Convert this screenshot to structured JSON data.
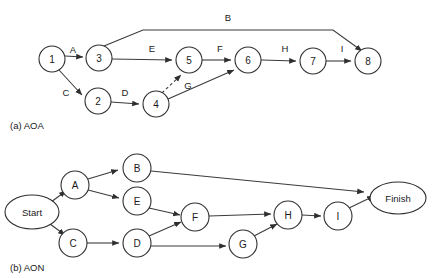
{
  "figure": {
    "colors": {
      "stroke": "#3b3b3b",
      "node_stroke": "#2f2f2f",
      "node_fill": "#ffffff",
      "text": "#1a1a1a",
      "background": "#ffffff"
    },
    "captions": {
      "aoa": "(a) AOA",
      "aon": "(b) AON"
    }
  },
  "aoa": {
    "nodes": [
      {
        "id": "n1",
        "label": "1",
        "cx": 52,
        "cy": 59,
        "r": 13
      },
      {
        "id": "n2",
        "label": "2",
        "cx": 98,
        "cy": 101,
        "r": 13
      },
      {
        "id": "n3",
        "label": "3",
        "cx": 99,
        "cy": 58,
        "r": 13
      },
      {
        "id": "n4",
        "label": "4",
        "cx": 156,
        "cy": 104,
        "r": 13
      },
      {
        "id": "n5",
        "label": "5",
        "cx": 189,
        "cy": 60,
        "r": 13
      },
      {
        "id": "n6",
        "label": "6",
        "cx": 248,
        "cy": 60,
        "r": 13
      },
      {
        "id": "n7",
        "label": "7",
        "cx": 313,
        "cy": 61,
        "r": 13
      },
      {
        "id": "n8",
        "label": "8",
        "cx": 368,
        "cy": 61,
        "r": 13
      }
    ],
    "edge_labels": [
      {
        "id": "A",
        "label": "A",
        "x": 73,
        "y": 49
      },
      {
        "id": "B",
        "label": "B",
        "x": 228,
        "y": 17
      },
      {
        "id": "C",
        "label": "C",
        "x": 66,
        "y": 92
      },
      {
        "id": "D",
        "label": "D",
        "x": 125,
        "y": 92
      },
      {
        "id": "E",
        "label": "E",
        "x": 152,
        "y": 48
      },
      {
        "id": "F",
        "label": "F",
        "x": 220,
        "y": 48
      },
      {
        "id": "G",
        "label": "G",
        "x": 188,
        "y": 85
      },
      {
        "id": "H",
        "label": "H",
        "x": 285,
        "y": 48
      },
      {
        "id": "I",
        "label": "I",
        "x": 342,
        "y": 48
      }
    ],
    "edges": [
      {
        "id": "A",
        "from": "n1",
        "to": "n3",
        "style": "solid"
      },
      {
        "id": "B",
        "from": "n3",
        "to": "n8",
        "style": "solid"
      },
      {
        "id": "C",
        "from": "n1",
        "to": "n2",
        "style": "solid"
      },
      {
        "id": "D",
        "from": "n2",
        "to": "n4",
        "style": "solid"
      },
      {
        "id": "E",
        "from": "n3",
        "to": "n5",
        "style": "solid"
      },
      {
        "id": "dummy",
        "from": "n4",
        "to": "n5",
        "style": "dashed"
      },
      {
        "id": "G",
        "from": "n4",
        "to": "n6",
        "style": "solid"
      },
      {
        "id": "F",
        "from": "n5",
        "to": "n6",
        "style": "solid"
      },
      {
        "id": "H",
        "from": "n6",
        "to": "n7",
        "style": "solid"
      },
      {
        "id": "I",
        "from": "n7",
        "to": "n8",
        "style": "solid"
      }
    ]
  },
  "aon": {
    "nodes": [
      {
        "id": "start",
        "label": "Start",
        "cx": 32,
        "cy": 212,
        "rx": 27,
        "ry": 17,
        "shape": "ellipse"
      },
      {
        "id": "A",
        "label": "A",
        "cx": 75,
        "cy": 185,
        "r": 14,
        "shape": "circle"
      },
      {
        "id": "B",
        "label": "B",
        "cx": 137,
        "cy": 168,
        "r": 14,
        "shape": "circle"
      },
      {
        "id": "C",
        "label": "C",
        "cx": 73,
        "cy": 243,
        "r": 14,
        "shape": "circle"
      },
      {
        "id": "E",
        "label": "E",
        "cx": 137,
        "cy": 201,
        "r": 14,
        "shape": "circle"
      },
      {
        "id": "D",
        "label": "D",
        "cx": 137,
        "cy": 243,
        "r": 14,
        "shape": "circle"
      },
      {
        "id": "F",
        "label": "F",
        "cx": 195,
        "cy": 217,
        "r": 14,
        "shape": "circle"
      },
      {
        "id": "G",
        "label": "G",
        "cx": 243,
        "cy": 244,
        "r": 14,
        "shape": "circle"
      },
      {
        "id": "H",
        "label": "H",
        "cx": 288,
        "cy": 215,
        "r": 14,
        "shape": "circle"
      },
      {
        "id": "I",
        "label": "I",
        "cx": 338,
        "cy": 216,
        "r": 14,
        "shape": "circle"
      },
      {
        "id": "finish",
        "label": "Finish",
        "cx": 398,
        "cy": 198,
        "rx": 28,
        "ry": 16,
        "shape": "ellipse"
      }
    ],
    "edges": [
      {
        "from": "start",
        "to": "A"
      },
      {
        "from": "start",
        "to": "C"
      },
      {
        "from": "A",
        "to": "B"
      },
      {
        "from": "A",
        "to": "E"
      },
      {
        "from": "B",
        "to": "finish"
      },
      {
        "from": "E",
        "to": "F"
      },
      {
        "from": "C",
        "to": "D"
      },
      {
        "from": "D",
        "to": "F"
      },
      {
        "from": "D",
        "to": "G"
      },
      {
        "from": "F",
        "to": "H"
      },
      {
        "from": "G",
        "to": "H"
      },
      {
        "from": "H",
        "to": "I"
      },
      {
        "from": "I",
        "to": "finish"
      }
    ]
  }
}
